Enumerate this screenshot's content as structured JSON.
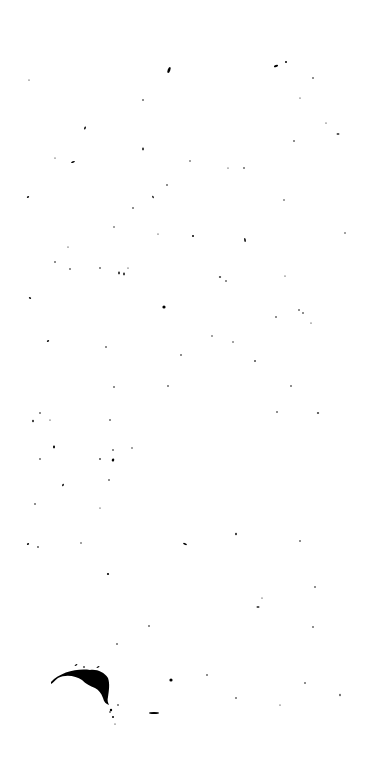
{
  "canvas": {
    "width": 378,
    "height": 773,
    "background": "#ffffff",
    "ink": "#000000"
  },
  "specks": [
    [
      169,
      70,
      1.3,
      3.2,
      20
    ],
    [
      286,
      62,
      1,
      1,
      0
    ],
    [
      276,
      66,
      2.2,
      1,
      -20
    ],
    [
      313,
      78,
      0.8,
      0.8,
      0
    ],
    [
      29,
      80,
      0.6,
      0.6,
      0
    ],
    [
      143,
      100,
      0.8,
      0.8,
      0
    ],
    [
      300,
      98,
      0.6,
      0.6,
      0
    ],
    [
      85,
      128,
      0.8,
      1.6,
      20
    ],
    [
      326,
      123,
      0.6,
      0.6,
      0
    ],
    [
      338,
      134,
      1.5,
      0.8,
      0
    ],
    [
      294,
      141,
      0.8,
      0.8,
      0
    ],
    [
      73,
      162,
      2,
      0.8,
      -20
    ],
    [
      55,
      158,
      0.6,
      0.6,
      0
    ],
    [
      143,
      149,
      0.8,
      1.4,
      0
    ],
    [
      190,
      161,
      0.7,
      0.7,
      0
    ],
    [
      244,
      168,
      0.8,
      0.8,
      0
    ],
    [
      167,
      185,
      0.8,
      0.8,
      0
    ],
    [
      228,
      168,
      0.6,
      0.6,
      0
    ],
    [
      28,
      197,
      1.2,
      0.8,
      -20
    ],
    [
      153,
      197,
      0.7,
      1.4,
      -20
    ],
    [
      133,
      208,
      0.8,
      0.8,
      0
    ],
    [
      284,
      200,
      0.7,
      0.7,
      0
    ],
    [
      114,
      227,
      0.7,
      0.7,
      0
    ],
    [
      158,
      234,
      0.6,
      0.6,
      0
    ],
    [
      193,
      236,
      1,
      1,
      0
    ],
    [
      245,
      240,
      0.8,
      2,
      -10
    ],
    [
      345,
      233,
      0.7,
      0.7,
      0
    ],
    [
      68,
      247,
      0.6,
      0.6,
      0
    ],
    [
      55,
      262,
      0.8,
      0.8,
      0
    ],
    [
      70,
      269,
      0.8,
      0.8,
      0
    ],
    [
      100,
      268,
      0.8,
      0.8,
      0
    ],
    [
      119,
      273,
      0.8,
      1.4,
      0
    ],
    [
      124,
      274,
      0.8,
      1.4,
      0
    ],
    [
      128,
      268,
      0.6,
      0.6,
      0
    ],
    [
      220,
      277,
      1.2,
      0.8,
      0
    ],
    [
      226,
      281,
      0.8,
      0.8,
      0
    ],
    [
      285,
      276,
      0.6,
      0.6,
      0
    ],
    [
      30,
      298,
      1.2,
      0.8,
      20
    ],
    [
      164,
      307,
      1.6,
      1.6,
      0
    ],
    [
      276,
      317,
      0.8,
      0.8,
      0
    ],
    [
      299,
      310,
      0.8,
      0.8,
      0
    ],
    [
      303,
      313,
      0.8,
      0.8,
      0
    ],
    [
      311,
      323,
      0.6,
      0.6,
      0
    ],
    [
      48,
      341,
      1.2,
      0.8,
      -20
    ],
    [
      106,
      347,
      0.8,
      0.8,
      0
    ],
    [
      212,
      336,
      0.7,
      0.7,
      0
    ],
    [
      233,
      342,
      0.7,
      0.7,
      0
    ],
    [
      255,
      361,
      1,
      0.8,
      0
    ],
    [
      181,
      355,
      0.8,
      0.8,
      0
    ],
    [
      114,
      387,
      0.8,
      0.8,
      0
    ],
    [
      168,
      386,
      0.8,
      0.8,
      0
    ],
    [
      291,
      386,
      0.8,
      0.8,
      0
    ],
    [
      277,
      412,
      0.8,
      0.8,
      0
    ],
    [
      318,
      413,
      1.2,
      0.8,
      0
    ],
    [
      40,
      413,
      0.8,
      0.8,
      0
    ],
    [
      33,
      421,
      0.8,
      1.2,
      0
    ],
    [
      50,
      420,
      0.6,
      0.6,
      0
    ],
    [
      110,
      420,
      0.8,
      0.8,
      0
    ],
    [
      54,
      447,
      1,
      1.4,
      0
    ],
    [
      113,
      450,
      0.8,
      0.8,
      0
    ],
    [
      132,
      448,
      0.7,
      0.7,
      0
    ],
    [
      40,
      459,
      0.8,
      0.8,
      0
    ],
    [
      100,
      459,
      1,
      0.8,
      0
    ],
    [
      113,
      460,
      1.2,
      1.6,
      20
    ],
    [
      109,
      480,
      0.8,
      0.8,
      0
    ],
    [
      63,
      485,
      0.8,
      1.4,
      20
    ],
    [
      35,
      504,
      0.8,
      0.8,
      0
    ],
    [
      100,
      508,
      0.6,
      0.6,
      0
    ],
    [
      38,
      547,
      0.9,
      0.8,
      0
    ],
    [
      81,
      543,
      0.7,
      0.7,
      0
    ],
    [
      28,
      544,
      1.2,
      0.8,
      -30
    ],
    [
      185,
      544,
      2,
      0.9,
      20
    ],
    [
      236,
      534,
      0.8,
      1.2,
      0
    ],
    [
      300,
      541,
      0.8,
      0.8,
      0
    ],
    [
      108,
      574,
      1.1,
      1.1,
      0
    ],
    [
      315,
      587,
      0.8,
      0.8,
      0
    ],
    [
      258,
      607,
      1.6,
      0.8,
      0
    ],
    [
      262,
      598,
      0.6,
      0.6,
      0
    ],
    [
      149,
      626,
      0.8,
      0.8,
      0
    ],
    [
      117,
      644,
      0.8,
      0.8,
      0
    ],
    [
      313,
      627,
      0.8,
      0.8,
      0
    ],
    [
      84,
      667,
      1,
      0.8,
      0
    ],
    [
      207,
      675,
      0.8,
      0.8,
      0
    ],
    [
      171,
      680,
      1.6,
      1.6,
      0
    ],
    [
      305,
      683,
      0.8,
      0.8,
      0
    ],
    [
      236,
      698,
      0.8,
      0.8,
      0
    ],
    [
      340,
      695,
      0.6,
      1.2,
      0
    ],
    [
      280,
      705,
      0.6,
      0.6,
      0
    ],
    [
      118,
      705,
      0.8,
      0.8,
      0
    ],
    [
      110,
      712,
      0.8,
      0.8,
      0
    ],
    [
      115,
      724,
      0.6,
      0.6,
      0
    ]
  ],
  "blot": {
    "path": "M51,682 C60,672 78,668 90,670 C97,669 104,672 108,678 C110,684 109,690 108,697 C107,700 108,703 109,705 C106,704 104,702 103,698 C101,693 99,690 95,688 C90,686 86,684 82,680 C76,676 66,674 58,678 C55,680 53,683 51,684 Z",
    "extra": [
      [
        111,
        710,
        1.2,
        1.2,
        0
      ],
      [
        113,
        717,
        1,
        1,
        0
      ],
      [
        154,
        713,
        5,
        1.1,
        0
      ],
      [
        76,
        665,
        1.5,
        0.7,
        -30
      ],
      [
        98,
        667,
        1.6,
        0.7,
        -30
      ]
    ]
  }
}
